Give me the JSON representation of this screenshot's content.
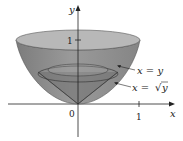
{
  "figure": {
    "axes": {
      "x_label": "x",
      "y_label": "y",
      "origin_label": "0",
      "x_tick_label": "1",
      "y_tick_label": "1"
    },
    "curves": [
      {
        "label": "x = y",
        "name": "line"
      },
      {
        "label": "x = √y",
        "name": "sqrt-curve",
        "lhs": "x = ",
        "radical": "√",
        "radicand": "y"
      }
    ],
    "colors": {
      "paraboloid_fill": "#8f8f8f",
      "rim_fill": "#b8b8b8",
      "cone_fill": "#707070",
      "axis": "#222222"
    }
  }
}
